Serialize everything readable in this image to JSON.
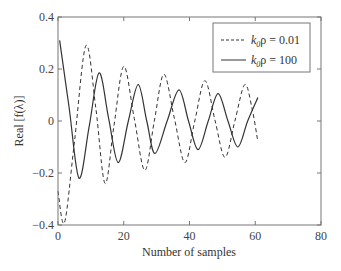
{
  "chart_data": {
    "type": "line",
    "title": "",
    "xlabel": "Number of samples",
    "ylabel": "Real [f(λ)]",
    "xlim": [
      0,
      80
    ],
    "ylim": [
      -0.4,
      0.4
    ],
    "xticks": [
      "0",
      "20",
      "40",
      "60",
      "80"
    ],
    "yticks": [
      "0.4",
      "0.2",
      "0",
      "−0.2",
      "−0.4"
    ],
    "grid": false,
    "legend_position": "upper right",
    "series": [
      {
        "name": "k0ρ = 0.01",
        "style": "dashed",
        "x": [
          0,
          2,
          5,
          8.5,
          11.5,
          14.3,
          17,
          20,
          23.2,
          26.4,
          29.3,
          32.2,
          35.4,
          38.6,
          41.6,
          44.7,
          47.8,
          50.8,
          53.8,
          56.8,
          59,
          60.8
        ],
        "y": [
          -0.27,
          -0.39,
          -0.08,
          0.29,
          0.05,
          -0.24,
          -0.02,
          0.21,
          0.01,
          -0.19,
          0.0,
          0.18,
          0.01,
          -0.16,
          0.0,
          0.155,
          0.0,
          -0.14,
          0.0,
          0.14,
          0.05,
          -0.08
        ]
      },
      {
        "name": "k0ρ = 100",
        "style": "solid",
        "x": [
          0.5,
          3.4,
          6.4,
          9.5,
          12.5,
          15.4,
          18.3,
          21.4,
          24.4,
          27,
          29.5,
          33.2,
          36.8,
          39.7,
          42.6,
          45.7,
          48.7,
          51.7,
          54.7,
          57.7,
          60.8
        ],
        "y": [
          0.31,
          0.05,
          -0.22,
          -0.02,
          0.185,
          0.01,
          -0.16,
          0.0,
          0.14,
          0.0,
          -0.125,
          0.0,
          0.12,
          0.0,
          -0.11,
          0.0,
          0.105,
          0.0,
          -0.1,
          0.0,
          0.09
        ]
      }
    ]
  },
  "legend": {
    "items": [
      {
        "prefix": "k",
        "sub": "0",
        "suffix": "ρ = 0.01"
      },
      {
        "prefix": "k",
        "sub": "0",
        "suffix": "ρ = 100"
      }
    ]
  }
}
